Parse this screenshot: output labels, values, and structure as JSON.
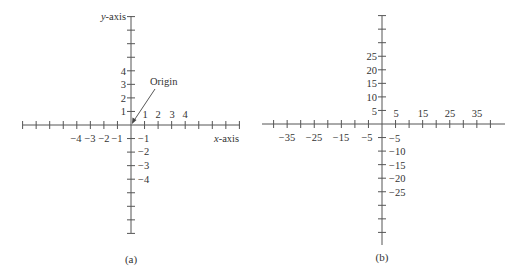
{
  "panels": [
    {
      "id": "a",
      "caption": "(a)",
      "x_axis_label": {
        "var": "x",
        "suffix": "-axis"
      },
      "y_axis_label": {
        "var": "y",
        "suffix": "-axis"
      },
      "origin_annotation": "Origin",
      "tick_step": 1,
      "tick_count_each_side": 8,
      "x_positive_labels": [
        "1",
        "2",
        "3",
        "4"
      ],
      "x_negative_labels": [
        "−4",
        "−3",
        "−2",
        "−1"
      ],
      "y_positive_labels": [
        "1",
        "2",
        "3",
        "4"
      ],
      "y_negative_labels": [
        "−1",
        "−2",
        "−3",
        "−4"
      ]
    },
    {
      "id": "b",
      "caption": "(b)",
      "tick_step": 5,
      "tick_count_each_side": 8,
      "x_positive_labels": [
        "5",
        "15",
        "25",
        "35"
      ],
      "x_negative_labels": [
        "−35",
        "−25",
        "−15",
        "−5"
      ],
      "y_positive_labels": [
        "5",
        "10",
        "15",
        "20",
        "25"
      ],
      "y_negative_labels": [
        "−5",
        "−10",
        "−15",
        "−20",
        "−25"
      ]
    }
  ]
}
